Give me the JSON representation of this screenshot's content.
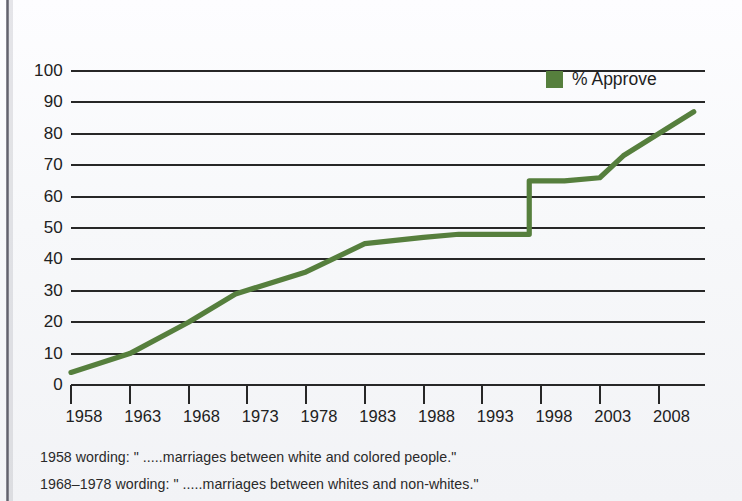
{
  "chart_data": {
    "type": "line",
    "title": "",
    "xlabel": "",
    "ylabel": "",
    "ylim": [
      0,
      100
    ],
    "xlim": [
      1958,
      2011
    ],
    "grid": true,
    "legend_position": "top-right",
    "ytick_labels": [
      "100",
      "90",
      "80",
      "70",
      "60",
      "50",
      "40",
      "30",
      "20",
      "10",
      "0"
    ],
    "ytick_values": [
      100,
      90,
      80,
      70,
      60,
      50,
      40,
      30,
      20,
      10,
      0
    ],
    "xtick_labels": [
      "1958",
      "1963",
      "1968",
      "1973",
      "1978",
      "1983",
      "1988",
      "1993",
      "1998",
      "2003",
      "2008"
    ],
    "xtick_values": [
      1958,
      1963,
      1968,
      1973,
      1978,
      1983,
      1988,
      1993,
      1998,
      2003,
      2008
    ],
    "series": [
      {
        "name": "% Approve",
        "color": "#567f3d",
        "x": [
          1958,
          1963,
          1968,
          1972,
          1978,
          1983,
          1988,
          1991,
          1994,
          1997,
          1997,
          2000,
          2003,
          2005,
          2008,
          2011
        ],
        "values": [
          4,
          10,
          20,
          29,
          36,
          45,
          47,
          48,
          48,
          48,
          65,
          65,
          66,
          73,
          80,
          87
        ]
      }
    ],
    "annotations": []
  },
  "legend": {
    "label": "% Approve",
    "swatch_color": "#567f3d"
  },
  "footnotes": [
    "1958 wording: \" .....marriages between white and colored people.\"",
    "1968–1978 wording: \" .....marriages between whites and non-whites.\""
  ],
  "colors": {
    "line": "#567f3d",
    "grid": "#272727",
    "axis": "#272727",
    "background": "#f7f8fa",
    "text": "#212121"
  }
}
